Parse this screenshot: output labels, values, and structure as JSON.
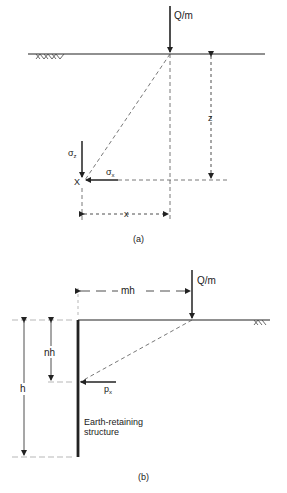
{
  "figure_a": {
    "load_label": "Q/m",
    "depth_label": "z",
    "offset_label": "x",
    "point_label": "X",
    "sigma_z_label": "σ",
    "sigma_z_sub": "z",
    "sigma_x_label": "σ",
    "sigma_x_sub": "x",
    "caption": "(a)"
  },
  "figure_b": {
    "load_label": "Q/m",
    "offset_label": "mh",
    "depth_label": "nh",
    "height_label": "h",
    "pressure_label": "p",
    "pressure_sub": "x",
    "structure_label_line1": "Earth-retaining",
    "structure_label_line2": "structure",
    "caption": "(b)"
  },
  "colors": {
    "line": "#222222",
    "dashed": "#555555",
    "background": "#ffffff"
  }
}
